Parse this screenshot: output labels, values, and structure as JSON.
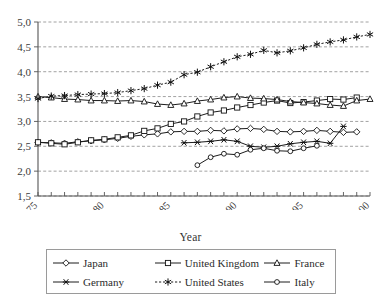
{
  "chart_data": {
    "type": "line",
    "title": "",
    "xlabel": "Year",
    "ylabel": "",
    "xlim": [
      1975,
      2000
    ],
    "ylim": [
      1.5,
      5.0
    ],
    "ytick_labels": [
      "5,0",
      "4,5",
      "4,0",
      "3,5",
      "3,0",
      "2,5",
      "2,0",
      "1,5"
    ],
    "ytick_values": [
      5.0,
      4.5,
      4.0,
      3.5,
      3.0,
      2.5,
      2.0,
      1.5
    ],
    "xtick_labels": [
      "1975",
      "80",
      "85",
      "90",
      "95",
      "00"
    ],
    "xtick_values": [
      1975,
      1980,
      1985,
      1990,
      1995,
      2000
    ],
    "grid": true,
    "legend_position": "below",
    "x": [
      1975,
      1976,
      1977,
      1978,
      1979,
      1980,
      1981,
      1982,
      1983,
      1984,
      1985,
      1986,
      1987,
      1988,
      1989,
      1990,
      1991,
      1992,
      1993,
      1994,
      1995,
      1996,
      1997,
      1998,
      1999,
      2000
    ],
    "series": [
      {
        "name": "Japan",
        "marker": "diamond",
        "x": [
          1975,
          1976,
          1977,
          1978,
          1979,
          1980,
          1981,
          1982,
          1983,
          1984,
          1985,
          1986,
          1987,
          1988,
          1989,
          1990,
          1991,
          1992,
          1993,
          1994,
          1995,
          1996,
          1997,
          1998,
          1999
        ],
        "values": [
          2.58,
          2.57,
          2.56,
          2.59,
          2.61,
          2.63,
          2.66,
          2.7,
          2.73,
          2.75,
          2.79,
          2.8,
          2.8,
          2.82,
          2.81,
          2.85,
          2.86,
          2.84,
          2.8,
          2.79,
          2.8,
          2.82,
          2.8,
          2.78,
          2.79
        ]
      },
      {
        "name": "United Kingdom",
        "marker": "square",
        "x": [
          1975,
          1976,
          1977,
          1978,
          1979,
          1980,
          1981,
          1982,
          1983,
          1984,
          1985,
          1986,
          1987,
          1988,
          1989,
          1990,
          1991,
          1992,
          1993,
          1994,
          1995,
          1996,
          1997,
          1998,
          1999
        ],
        "values": [
          2.58,
          2.56,
          2.54,
          2.58,
          2.62,
          2.64,
          2.68,
          2.72,
          2.81,
          2.86,
          2.95,
          3.0,
          3.1,
          3.18,
          3.22,
          3.28,
          3.33,
          3.38,
          3.42,
          3.37,
          3.39,
          3.42,
          3.45,
          3.44,
          3.48
        ]
      },
      {
        "name": "France",
        "marker": "triangle",
        "x": [
          1975,
          1976,
          1977,
          1978,
          1979,
          1980,
          1981,
          1982,
          1983,
          1984,
          1985,
          1986,
          1987,
          1988,
          1989,
          1990,
          1991,
          1992,
          1993,
          1994,
          1995,
          1996,
          1997,
          1998,
          1999,
          2000
        ],
        "values": [
          3.5,
          3.48,
          3.45,
          3.44,
          3.42,
          3.42,
          3.41,
          3.42,
          3.4,
          3.35,
          3.33,
          3.36,
          3.41,
          3.44,
          3.48,
          3.5,
          3.47,
          3.46,
          3.44,
          3.4,
          3.38,
          3.36,
          3.33,
          3.31,
          3.42,
          3.45
        ]
      },
      {
        "name": "Germany",
        "marker": "cross",
        "x": [
          1986,
          1987,
          1988,
          1989,
          1990,
          1991,
          1992,
          1993,
          1994,
          1995,
          1996,
          1997,
          1998
        ],
        "values": [
          2.57,
          2.58,
          2.6,
          2.63,
          2.6,
          2.5,
          2.48,
          2.5,
          2.55,
          2.58,
          2.6,
          2.56,
          2.9
        ]
      },
      {
        "name": "United States",
        "marker": "asterisk",
        "x": [
          1975,
          1976,
          1977,
          1978,
          1979,
          1980,
          1981,
          1982,
          1983,
          1984,
          1985,
          1986,
          1987,
          1988,
          1989,
          1990,
          1991,
          1992,
          1993,
          1994,
          1995,
          1996,
          1997,
          1998,
          1999,
          2000
        ],
        "values": [
          3.46,
          3.51,
          3.52,
          3.54,
          3.55,
          3.56,
          3.58,
          3.62,
          3.66,
          3.73,
          3.79,
          3.94,
          3.99,
          4.1,
          4.2,
          4.3,
          4.35,
          4.43,
          4.38,
          4.42,
          4.48,
          4.55,
          4.6,
          4.64,
          4.7,
          4.75
        ]
      },
      {
        "name": "Italy",
        "marker": "circle",
        "x": [
          1987,
          1988,
          1989,
          1990,
          1991,
          1992,
          1993,
          1994,
          1995,
          1996
        ],
        "values": [
          2.12,
          2.28,
          2.35,
          2.33,
          2.43,
          2.46,
          2.41,
          2.4,
          2.46,
          2.51
        ]
      }
    ]
  },
  "axis": {
    "x_title": "Year"
  },
  "legend": {
    "rows": [
      [
        {
          "label": "Japan",
          "marker": "diamond"
        },
        {
          "label": "United Kingdom",
          "marker": "square"
        },
        {
          "label": "France",
          "marker": "triangle"
        }
      ],
      [
        {
          "label": "Germany",
          "marker": "cross"
        },
        {
          "label": "United States",
          "marker": "asterisk"
        },
        {
          "label": "Italy",
          "marker": "circle"
        }
      ]
    ]
  },
  "colors": {
    "line": "#1c1c1c",
    "grid": "#8a8a8a",
    "axis": "#555555",
    "text": "#2b2b2b",
    "background": "#ffffff"
  }
}
